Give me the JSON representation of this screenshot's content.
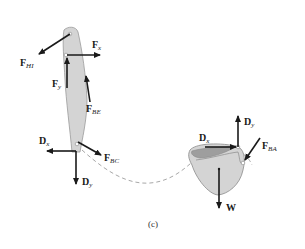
{
  "figure": {
    "caption": "(c)",
    "colors": {
      "arrow": "#1a1a1a",
      "body_fill": "#d4d4d4",
      "body_stroke": "#9a9a9a",
      "dash": "#a8a8a8"
    }
  },
  "bone": {
    "forces": [
      {
        "id": "FHI",
        "main": "F",
        "sub": "HI"
      },
      {
        "id": "Fx",
        "main": "F",
        "sub": "x"
      },
      {
        "id": "Fy",
        "main": "F",
        "sub": "y"
      },
      {
        "id": "FBE",
        "main": "F",
        "sub": "BE"
      },
      {
        "id": "Dx",
        "main": "D",
        "sub": "x"
      },
      {
        "id": "Dy",
        "main": "D",
        "sub": "y"
      },
      {
        "id": "FBC",
        "main": "F",
        "sub": "BC"
      }
    ]
  },
  "bucket": {
    "forces": [
      {
        "id": "Dx",
        "main": "D",
        "sub": "x"
      },
      {
        "id": "Dy",
        "main": "D",
        "sub": "y"
      },
      {
        "id": "FBA",
        "main": "F",
        "sub": "BA"
      },
      {
        "id": "W",
        "main": "W",
        "sub": ""
      }
    ]
  }
}
